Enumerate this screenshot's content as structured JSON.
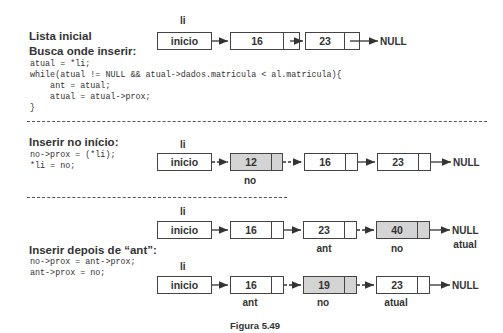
{
  "section1": {
    "title_line1": "Lista inicial",
    "title_line2": "Busca onde inserir:",
    "code": [
      "atual = *li;",
      "while(atual != NULL && atual->dados.matricula < al.matricula){",
      "    ant = atual;",
      "    atual = atual->prox;",
      "}"
    ],
    "li_label": "li",
    "head_label": "inicio",
    "nodes": [
      "16",
      "23"
    ],
    "null_label": "NULL"
  },
  "section2": {
    "title": "Inserir no início:",
    "code": [
      "no->prox = (*li);",
      "*li = no;"
    ],
    "li_label": "li",
    "head_label": "inicio",
    "nodes": [
      "12",
      "16",
      "23"
    ],
    "highlight_node": "12",
    "no_label": "no",
    "null_label": "NULL"
  },
  "section3": {
    "title": "Inserir depois de “ant”:",
    "code": [
      "no->prox = ant->prox;",
      "ant->prox = no;"
    ],
    "diagram_a": {
      "li_label": "li",
      "head_label": "inicio",
      "nodes": [
        "16",
        "23",
        "40"
      ],
      "highlight_node": "40",
      "ant_label": "ant",
      "no_label": "no",
      "null_label": "NULL",
      "atual_label": "atual"
    },
    "diagram_b": {
      "li_label": "li",
      "head_label": "inicio",
      "nodes": [
        "16",
        "19",
        "23"
      ],
      "highlight_node": "19",
      "ant_label": "ant",
      "no_label": "no",
      "atual_label": "atual",
      "null_label": "NULL"
    }
  },
  "caption": "Figura 5.49",
  "colors": {
    "highlight": "#d4d4d4",
    "line": "#444444"
  }
}
